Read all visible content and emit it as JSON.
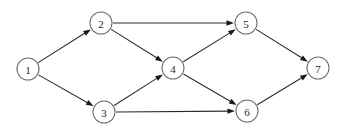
{
  "figure": {
    "background_color": "#ffffff",
    "node_fill_color": "#ffffff",
    "node_stroke_color": "#6e6e6e",
    "edge_color": "#2b2b2b",
    "label_color": "#1f1f1f",
    "width": 346,
    "height": 131
  },
  "chart_data": {
    "type": "diagram",
    "title": "",
    "subtitle": "",
    "xlabel": "",
    "ylabel": "",
    "legend": [],
    "grid": false,
    "node_radius": 11,
    "nodes": [
      {
        "id": "1",
        "label": "1",
        "x": 28,
        "y": 69
      },
      {
        "id": "2",
        "label": "2",
        "x": 101,
        "y": 23
      },
      {
        "id": "3",
        "label": "3",
        "x": 104,
        "y": 112
      },
      {
        "id": "4",
        "label": "4",
        "x": 173,
        "y": 68
      },
      {
        "id": "5",
        "label": "5",
        "x": 246,
        "y": 23
      },
      {
        "id": "6",
        "label": "6",
        "x": 247,
        "y": 111
      },
      {
        "id": "7",
        "label": "7",
        "x": 318,
        "y": 68
      }
    ],
    "edges": [
      {
        "from": "1",
        "to": "2",
        "directed": true,
        "label": ""
      },
      {
        "from": "1",
        "to": "3",
        "directed": true,
        "label": ""
      },
      {
        "from": "2",
        "to": "5",
        "directed": true,
        "label": ""
      },
      {
        "from": "2",
        "to": "4",
        "directed": true,
        "label": ""
      },
      {
        "from": "3",
        "to": "4",
        "directed": true,
        "label": ""
      },
      {
        "from": "3",
        "to": "6",
        "directed": true,
        "label": ""
      },
      {
        "from": "4",
        "to": "5",
        "directed": true,
        "label": ""
      },
      {
        "from": "4",
        "to": "6",
        "directed": true,
        "label": ""
      },
      {
        "from": "5",
        "to": "7",
        "directed": true,
        "label": ""
      },
      {
        "from": "6",
        "to": "7",
        "directed": true,
        "label": ""
      }
    ]
  }
}
